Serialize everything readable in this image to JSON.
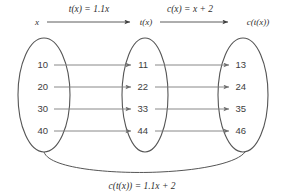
{
  "diagram": {
    "top_flow": {
      "start_label": "x",
      "middle_label": "t(x)",
      "end_label": "c(t(x))",
      "arrow1_label": "t(x) = 1.1x",
      "arrow2_label": "c(x) = x + 2"
    },
    "sets": [
      {
        "name": "input-set",
        "values": [
          "10",
          "20",
          "30",
          "40"
        ]
      },
      {
        "name": "intermediate-set",
        "values": [
          "11",
          "22",
          "33",
          "44"
        ]
      },
      {
        "name": "output-set",
        "values": [
          "13",
          "24",
          "35",
          "46"
        ]
      }
    ],
    "composite_label": "c(t(x)) = 1.1x + 2",
    "colors": {
      "background": "#ffffff",
      "oval_stroke": "#555555",
      "arrow_stroke": "#7a7a7a",
      "text": "#3d3d3d"
    }
  }
}
